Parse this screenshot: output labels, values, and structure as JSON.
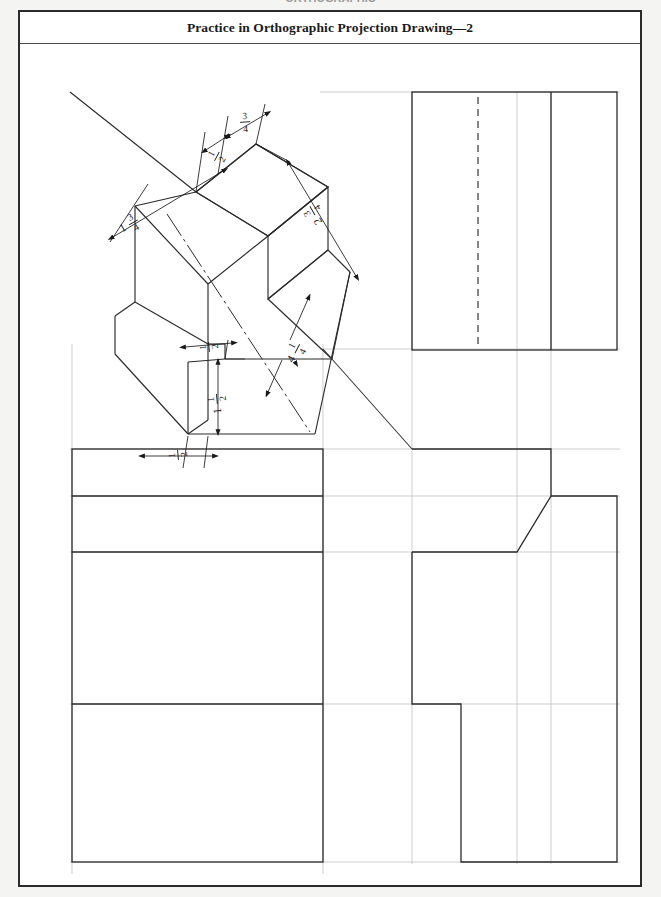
{
  "page": {
    "cut_off_header": "ORTHOGRAPHIC",
    "title": "Practice in Orthographic Projection Drawing—2",
    "background_color": "#f2f2f2",
    "sheet_color": "#ffffff",
    "line_color": "#2b2b2b",
    "construction_line_color": "#b0b0b0"
  },
  "views": {
    "isometric": {
      "name": "Isometric pictorial view",
      "dimensions": [
        {
          "id": "iso-dim-top-left-width",
          "whole": "",
          "numerator": "1",
          "denominator": "2",
          "display": "1/2"
        },
        {
          "id": "iso-dim-top-right-width",
          "whole": "",
          "numerator": "3",
          "denominator": "4",
          "display": "3/4"
        },
        {
          "id": "iso-dim-left-height",
          "whole": "1",
          "numerator": "3",
          "denominator": "4",
          "display": "1 3/4"
        },
        {
          "id": "iso-dim-right-depth",
          "whole": "2",
          "numerator": "3",
          "denominator": "4",
          "display": "2 3/4"
        },
        {
          "id": "iso-dim-notch-width",
          "whole": "",
          "numerator": "1",
          "denominator": "2",
          "display": "1/2"
        },
        {
          "id": "iso-dim-notch-height",
          "whole": "1",
          "numerator": "1",
          "denominator": "2",
          "display": "1 1/2"
        },
        {
          "id": "iso-dim-base-width",
          "whole": "",
          "numerator": "1",
          "denominator": "2",
          "display": "1/2"
        },
        {
          "id": "iso-dim-overall-length",
          "whole": "4",
          "numerator": "1",
          "denominator": "4",
          "display": "4 1/4"
        }
      ]
    },
    "top_view": {
      "name": "Top view",
      "has_hidden_line": true
    },
    "front_view": {
      "name": "Front view",
      "has_hidden_line": false
    },
    "right_side_view": {
      "name": "Right side view",
      "has_angled_cut": true
    },
    "miter_line": {
      "name": "45 degree miter line",
      "angle": "45"
    }
  }
}
